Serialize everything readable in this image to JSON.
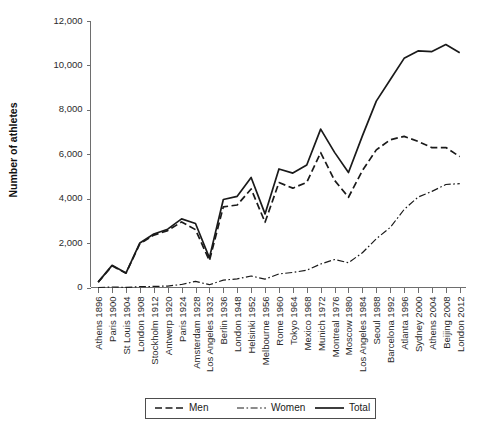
{
  "chart_data": {
    "type": "line",
    "title": "",
    "xlabel": "",
    "ylabel": "Number of athletes",
    "ylim": [
      0,
      12000
    ],
    "ytick_values": [
      0,
      2000,
      4000,
      6000,
      8000,
      10000,
      12000
    ],
    "ytick_labels": [
      "0",
      "2,000",
      "4,000",
      "6,000",
      "8,000",
      "10,000",
      "12,000"
    ],
    "grid": false,
    "legend_position": "bottom-center",
    "categories": [
      "Athens 1896",
      "Paris 1900",
      "St Louis 1904",
      "London 1908",
      "Stockholm 1912",
      "Antwerp 1920",
      "Paris 1924",
      "Amsterdam 1928",
      "Los Angeles 1932",
      "Berlin 1936",
      "London 1948",
      "Helsinki 1952",
      "Melbourne 1956",
      "Rome 1960",
      "Tokyo 1964",
      "Mexico 1968",
      "Munich 1972",
      "Montreal 1976",
      "Moscow 1980",
      "Los Angeles 1984",
      "Seoul 1988",
      "Barcelona 1992",
      "Atlanta 1996",
      "Sydney 2000",
      "Athens 2004",
      "Beijing 2008",
      "London 2012"
    ],
    "series": [
      {
        "name": "Men",
        "style": "dashed",
        "values": [
          241,
          975,
          645,
          1971,
          2359,
          2561,
          2954,
          2606,
          1206,
          3632,
          3714,
          4436,
          2938,
          4727,
          4473,
          4735,
          6075,
          4824,
          4064,
          5263,
          6197,
          6652,
          6806,
          6582,
          6296,
          6305,
          5892
        ]
      },
      {
        "name": "Women",
        "style": "dashdot",
        "values": [
          0,
          22,
          6,
          37,
          48,
          65,
          135,
          277,
          126,
          331,
          390,
          519,
          376,
          611,
          678,
          781,
          1059,
          1260,
          1115,
          1566,
          2194,
          2704,
          3512,
          4069,
          4329,
          4637,
          4676
        ]
      },
      {
        "name": "Total",
        "style": "solid",
        "values": [
          241,
          997,
          651,
          2008,
          2407,
          2626,
          3089,
          2883,
          1332,
          3963,
          4104,
          4955,
          3314,
          5338,
          5151,
          5516,
          7134,
          6084,
          5179,
          6829,
          8391,
          9356,
          10318,
          10651,
          10625,
          10942,
          10568
        ]
      }
    ]
  },
  "legend": {
    "items": [
      {
        "label": "Men",
        "style": "dashed"
      },
      {
        "label": "Women",
        "style": "dashdot"
      },
      {
        "label": "Total",
        "style": "solid"
      }
    ]
  }
}
